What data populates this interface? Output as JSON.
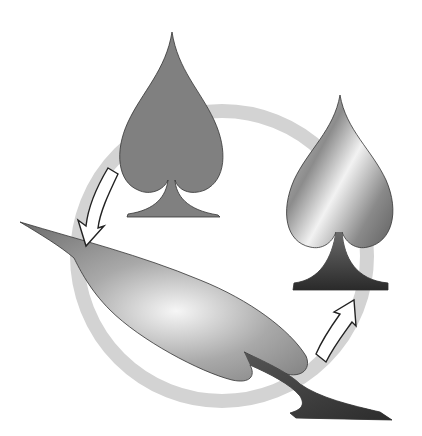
{
  "diagram": {
    "title": "Spade transformation cycle",
    "ring": {
      "color": "#d3d3d3",
      "cx": 222,
      "cy": 256,
      "r": 145,
      "stroke_width": 14
    },
    "nodes": [
      {
        "id": "flat-spade",
        "label": "Flat grey spade",
        "fill": "#808080"
      },
      {
        "id": "stretched-spade",
        "label": "Stretched distorted spade",
        "fill_gradient": [
          "#f4f4f4",
          "#9a9a9a",
          "#4a4a4a"
        ]
      },
      {
        "id": "shaded-spade",
        "label": "Shaded metallic spade",
        "fill_gradient": [
          "#f0f0f0",
          "#8a8a8a",
          "#3a3a3a"
        ]
      }
    ],
    "arrows": [
      {
        "id": "arrow-flat-to-stretched",
        "from": "flat-spade",
        "to": "stretched-spade",
        "fill": "#ffffff",
        "stroke": "#222222"
      },
      {
        "id": "arrow-stretched-to-shaded",
        "from": "stretched-spade",
        "to": "shaded-spade",
        "fill": "#ffffff",
        "stroke": "#222222"
      }
    ]
  }
}
